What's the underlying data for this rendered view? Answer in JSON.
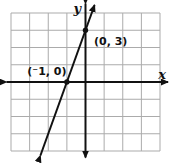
{
  "figure": {
    "width": 174,
    "height": 163,
    "background_color": "#ffffff",
    "grid_color": "#ababab",
    "axis_color": "#111111",
    "line_color": "#111111"
  },
  "chart_data": {
    "type": "line",
    "title": "",
    "xlabel": "x",
    "ylabel": "y",
    "xlim": [
      -4,
      4
    ],
    "ylim": [
      -4,
      4
    ],
    "grid": true,
    "grid_step": 1,
    "axis_ticks_labeled": false,
    "series": [
      {
        "name": "line-through-marked-points",
        "slope": 3,
        "y_intercept": 3,
        "x_intercept": -1,
        "points": [
          [
            -1,
            0
          ],
          [
            0,
            3
          ]
        ],
        "arrows_both_ends": true
      }
    ],
    "marked_points": [
      {
        "x": -1,
        "y": 0,
        "label": "(⁻1, 0)",
        "label_position": "above-left-of-point"
      },
      {
        "x": 0,
        "y": 3,
        "label": "(0, 3)",
        "label_position": "right-of-point"
      }
    ]
  }
}
